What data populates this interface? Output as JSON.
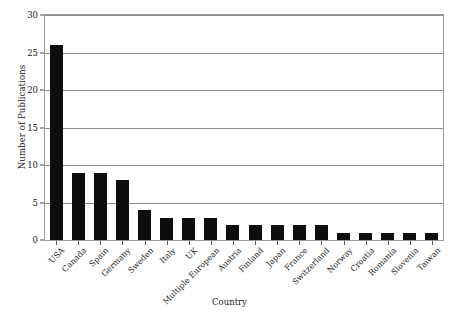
{
  "chart_data": {
    "type": "bar",
    "title": "",
    "xlabel": "Country",
    "ylabel": "Number of Publications",
    "categories": [
      "USA",
      "Canada",
      "Spain",
      "Germany",
      "Sweden",
      "Italy",
      "UK",
      "Multiple European",
      "Austria",
      "Finland",
      "Japan",
      "France",
      "Switzerland",
      "Norway",
      "Croatia",
      "Romania",
      "Slovenia",
      "Taiwan"
    ],
    "values": [
      26,
      9,
      9,
      8,
      4,
      3,
      3,
      3,
      2,
      2,
      2,
      2,
      2,
      1,
      1,
      1,
      1,
      1
    ],
    "ylim": [
      0,
      30
    ],
    "ytick_step": 5,
    "yticks": [
      0,
      5,
      10,
      15,
      20,
      25,
      30
    ],
    "ytick_labels": [
      "0",
      "5",
      "10",
      "15",
      "20",
      "25",
      "30"
    ],
    "grid": true,
    "grid_axis": "y",
    "legend": false,
    "bar_color": "#0d0d0d",
    "grid_color": "#8d8d8d",
    "frame_color": "#9a9a9a",
    "xtick_rotation": -45
  }
}
